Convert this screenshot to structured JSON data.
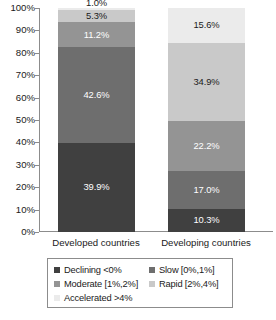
{
  "chart_data": {
    "type": "bar",
    "subtype": "stacked-100-percent",
    "title": "",
    "xlabel": "",
    "ylabel": "",
    "ylim": [
      0,
      100
    ],
    "grid": false,
    "legend_position": "bottom",
    "categories": [
      "Developed countries",
      "Developing countries"
    ],
    "y_ticks": [
      "0%",
      "10%",
      "20%",
      "30%",
      "40%",
      "50%",
      "60%",
      "70%",
      "80%",
      "90%",
      "100%"
    ],
    "series": [
      {
        "name": "Declining <0%",
        "color": "#404040",
        "values": [
          39.9,
          10.3
        ],
        "labels": [
          "39.9%",
          "10.3%"
        ]
      },
      {
        "name": "Slow [0%,1%]",
        "color": "#6e6e6e",
        "values": [
          42.6,
          17.0
        ],
        "labels": [
          "42.6%",
          "17.0%"
        ]
      },
      {
        "name": "Moderate [1%,2%]",
        "color": "#949494",
        "values": [
          11.2,
          22.2
        ],
        "labels": [
          "11.2%",
          "22.2%"
        ]
      },
      {
        "name": "Rapid [2%,4%]",
        "color": "#c9c9c9",
        "values": [
          5.3,
          34.9
        ],
        "labels": [
          "5.3%",
          "34.9%"
        ]
      },
      {
        "name": "Accelerated >4%",
        "color": "#ebebeb",
        "values": [
          1.0,
          15.6
        ],
        "labels": [
          "1.0%",
          "15.6%"
        ]
      }
    ]
  },
  "axis": {
    "ticks": [
      {
        "label": "100%",
        "value": 100
      },
      {
        "label": "90%",
        "value": 90
      },
      {
        "label": "80%",
        "value": 80
      },
      {
        "label": "70%",
        "value": 70
      },
      {
        "label": "60%",
        "value": 60
      },
      {
        "label": "50%",
        "value": 50
      },
      {
        "label": "40%",
        "value": 40
      },
      {
        "label": "30%",
        "value": 30
      },
      {
        "label": "20%",
        "value": 20
      },
      {
        "label": "10%",
        "value": 10
      },
      {
        "label": "0%",
        "value": 0
      }
    ]
  },
  "categories": [
    {
      "label": "Developed countries"
    },
    {
      "label": "Developing countries"
    }
  ],
  "bars": {
    "developed": {
      "name": "Developed countries",
      "segments": [
        {
          "label": "1.0%",
          "value": 1.0,
          "series": "Accelerated >4%",
          "color": "#ebebeb",
          "text": "dark",
          "placement": "outside-up"
        },
        {
          "label": "5.3%",
          "value": 5.3,
          "series": "Rapid [2%,4%]",
          "color": "#c9c9c9",
          "text": "dark",
          "placement": "inside"
        },
        {
          "label": "11.2%",
          "value": 11.2,
          "series": "Moderate [1%,2%]",
          "color": "#949494",
          "text": "light",
          "placement": "inside"
        },
        {
          "label": "42.6%",
          "value": 42.6,
          "series": "Slow [0%,1%]",
          "color": "#6e6e6e",
          "text": "light",
          "placement": "inside"
        },
        {
          "label": "39.9%",
          "value": 39.9,
          "series": "Declining <0%",
          "color": "#404040",
          "text": "light",
          "placement": "inside"
        }
      ]
    },
    "developing": {
      "name": "Developing countries",
      "segments": [
        {
          "label": "15.6%",
          "value": 15.6,
          "series": "Accelerated >4%",
          "color": "#ebebeb",
          "text": "dark",
          "placement": "inside"
        },
        {
          "label": "34.9%",
          "value": 34.9,
          "series": "Rapid [2%,4%]",
          "color": "#c9c9c9",
          "text": "dark",
          "placement": "inside"
        },
        {
          "label": "22.2%",
          "value": 22.2,
          "series": "Moderate [1%,2%]",
          "color": "#949494",
          "text": "light",
          "placement": "inside"
        },
        {
          "label": "17.0%",
          "value": 17.0,
          "series": "Slow [0%,1%]",
          "color": "#6e6e6e",
          "text": "light",
          "placement": "inside"
        },
        {
          "label": "10.3%",
          "value": 10.3,
          "series": "Declining <0%",
          "color": "#404040",
          "text": "light",
          "placement": "inside"
        }
      ]
    }
  },
  "legend": {
    "rows": [
      [
        {
          "label": "Declining <0%",
          "color": "#404040"
        },
        {
          "label": "Slow [0%,1%]",
          "color": "#6e6e6e"
        }
      ],
      [
        {
          "label": "Moderate [1%,2%]",
          "color": "#949494"
        },
        {
          "label": "Rapid [2%,4%]",
          "color": "#c9c9c9"
        }
      ],
      [
        {
          "label": "Accelerated >4%",
          "color": "#ebebeb"
        }
      ]
    ]
  },
  "colors": {
    "axis": "#8c8c8c",
    "text": "#1a1a1a",
    "background": "#ffffff"
  }
}
